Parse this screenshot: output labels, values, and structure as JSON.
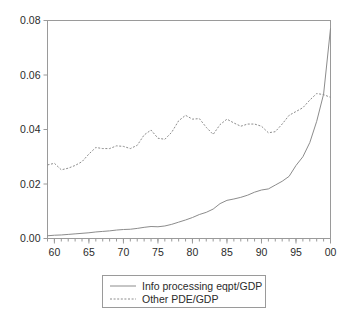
{
  "chart_data": {
    "type": "line",
    "title": "",
    "xlabel": "",
    "ylabel": "",
    "xlim": [
      1959,
      2000
    ],
    "ylim": [
      0.0,
      0.08
    ],
    "grid": false,
    "legend_position": "bottom-center",
    "ytick_labels": [
      "0.00",
      "0.02",
      "0.04",
      "0.06",
      "0.08"
    ],
    "ytick_values": [
      0.0,
      0.02,
      0.04,
      0.06,
      0.08
    ],
    "xtick_labels": [
      "60",
      "65",
      "70",
      "75",
      "80",
      "85",
      "90",
      "95",
      "00"
    ],
    "xtick_values": [
      1960,
      1965,
      1970,
      1975,
      1980,
      1985,
      1990,
      1995,
      2000
    ],
    "x": [
      1959,
      1960,
      1961,
      1962,
      1963,
      1964,
      1965,
      1966,
      1967,
      1968,
      1969,
      1970,
      1971,
      1972,
      1973,
      1974,
      1975,
      1976,
      1977,
      1978,
      1979,
      1980,
      1981,
      1982,
      1983,
      1984,
      1985,
      1986,
      1987,
      1988,
      1989,
      1990,
      1991,
      1992,
      1993,
      1994,
      1995,
      1996,
      1997,
      1998,
      1999,
      2000
    ],
    "series": [
      {
        "name": "Info processing eqpt/GDP",
        "style": "solid",
        "color": "#8c8c8c",
        "values": [
          0.001,
          0.0012,
          0.0013,
          0.0015,
          0.0017,
          0.0019,
          0.0021,
          0.0024,
          0.0026,
          0.0028,
          0.0031,
          0.0033,
          0.0034,
          0.0037,
          0.0041,
          0.0044,
          0.0043,
          0.0046,
          0.0052,
          0.006,
          0.0068,
          0.0077,
          0.0088,
          0.0096,
          0.0108,
          0.0128,
          0.014,
          0.0145,
          0.0151,
          0.0159,
          0.017,
          0.0178,
          0.0182,
          0.0196,
          0.021,
          0.0228,
          0.0268,
          0.03,
          0.0352,
          0.043,
          0.053,
          0.077
        ]
      },
      {
        "name": "Other PDE/GDP",
        "style": "dotted",
        "color": "#8c8c8c",
        "values": [
          0.027,
          0.0276,
          0.0252,
          0.0258,
          0.0268,
          0.0282,
          0.031,
          0.0334,
          0.033,
          0.033,
          0.034,
          0.0338,
          0.033,
          0.0342,
          0.038,
          0.0398,
          0.0368,
          0.0364,
          0.039,
          0.0432,
          0.0452,
          0.0438,
          0.044,
          0.0408,
          0.0382,
          0.0418,
          0.0438,
          0.0424,
          0.0412,
          0.042,
          0.042,
          0.0412,
          0.0388,
          0.0392,
          0.042,
          0.0452,
          0.0466,
          0.048,
          0.0508,
          0.0532,
          0.0528,
          0.0518
        ]
      }
    ]
  },
  "legend": {
    "entries": [
      {
        "label": "Info processing eqpt/GDP",
        "style": "solid"
      },
      {
        "label": "Other PDE/GDP",
        "style": "dotted"
      }
    ]
  }
}
